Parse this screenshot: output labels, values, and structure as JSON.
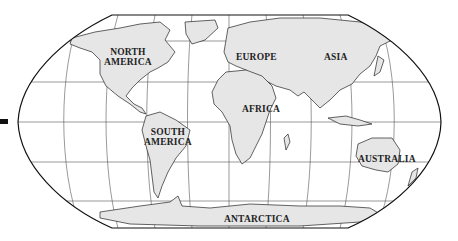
{
  "map": {
    "projection": "Robinson-style world outline",
    "colors": {
      "land": "#e6e6e6",
      "ocean": "#ffffff",
      "border": "#222222",
      "grid": "#555555"
    },
    "labels": {
      "north_america_1": "NORTH",
      "north_america_2": "AMERICA",
      "south_america_1": "SOUTH",
      "south_america_2": "AMERICA",
      "europe": "EUROPE",
      "asia": "ASIA",
      "africa": "AFRICA",
      "australia": "AUSTRALIA",
      "antarctica": "ANTARCTICA"
    }
  }
}
